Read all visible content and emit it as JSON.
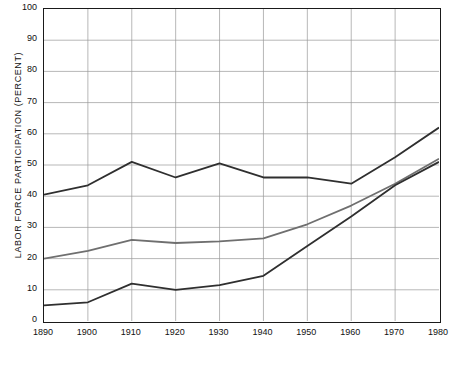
{
  "chart_data": {
    "type": "line",
    "title": "",
    "subtitle": "",
    "xlabel": "",
    "ylabel": "LABOR FORCE PARTICIPATION (PERCENT)",
    "x": [
      1890,
      1900,
      1910,
      1920,
      1930,
      1940,
      1950,
      1960,
      1970,
      1980
    ],
    "xlim": [
      1890,
      1980
    ],
    "ylim": [
      0,
      100
    ],
    "ytick_labels": [
      "0",
      "10",
      "20",
      "30",
      "40",
      "50",
      "60",
      "70",
      "80",
      "90",
      "100"
    ],
    "ytick_values": [
      0,
      10,
      20,
      30,
      40,
      50,
      60,
      70,
      80,
      90,
      100
    ],
    "xtick_labels": [
      "1890",
      "1900",
      "1910",
      "1920",
      "1930",
      "1940",
      "1950",
      "1960",
      "1970",
      "1980"
    ],
    "grid": true,
    "legend": "none",
    "series": [
      {
        "name": "upper-series",
        "color": "#2f2f2f",
        "values": [
          40.5,
          43.5,
          51.0,
          46.0,
          50.5,
          46.0,
          46.0,
          44.0,
          52.5,
          62.0
        ]
      },
      {
        "name": "middle-series",
        "color": "#6f6f6f",
        "values": [
          20.0,
          22.5,
          26.0,
          25.0,
          25.5,
          26.5,
          31.0,
          37.0,
          44.0,
          52.0
        ]
      },
      {
        "name": "lower-series",
        "color": "#2f2f2f",
        "values": [
          5.0,
          6.0,
          12.0,
          10.0,
          11.5,
          14.5,
          24.0,
          33.5,
          43.5,
          51.0
        ]
      }
    ]
  }
}
